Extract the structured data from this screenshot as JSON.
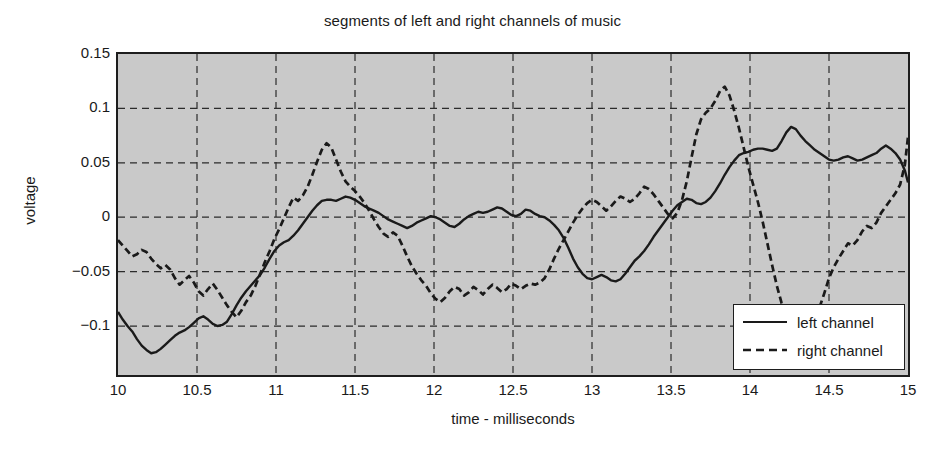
{
  "chart_data": {
    "type": "line",
    "title": "segments of left and right channels of music",
    "xlabel": "time - milliseconds",
    "ylabel": "voltage",
    "xlim": [
      10,
      15
    ],
    "ylim": [
      -0.145,
      0.15
    ],
    "xticks": [
      "10",
      "10.5",
      "11",
      "11.5",
      "12",
      "12.5",
      "13",
      "13.5",
      "14",
      "14.5",
      "15"
    ],
    "xtick_values": [
      10,
      10.5,
      11,
      11.5,
      12,
      12.5,
      13,
      13.5,
      14,
      14.5,
      15
    ],
    "yticks": [
      "0.15",
      "0.1",
      "0.05",
      "0",
      "-0.05",
      "-0.1"
    ],
    "ytick_values": [
      0.15,
      0.1,
      0.05,
      0,
      -0.05,
      -0.1
    ],
    "grid": true,
    "grid_style": "dashed",
    "legend_position": "bottom-right",
    "plot_background": "#c9c9c9",
    "line_color": "#1a1a1a",
    "series": [
      {
        "name": "left channel",
        "style": "solid",
        "x": [
          10.0,
          10.03,
          10.06,
          10.09,
          10.12,
          10.15,
          10.18,
          10.21,
          10.24,
          10.27,
          10.3,
          10.33,
          10.36,
          10.39,
          10.42,
          10.45,
          10.48,
          10.51,
          10.54,
          10.57,
          10.6,
          10.63,
          10.66,
          10.69,
          10.72,
          10.75,
          10.78,
          10.81,
          10.84,
          10.87,
          10.9,
          10.93,
          10.96,
          10.99,
          11.02,
          11.05,
          11.08,
          11.11,
          11.14,
          11.17,
          11.2,
          11.23,
          11.26,
          11.29,
          11.32,
          11.35,
          11.38,
          11.41,
          11.44,
          11.47,
          11.5,
          11.53,
          11.56,
          11.59,
          11.62,
          11.65,
          11.68,
          11.71,
          11.74,
          11.77,
          11.8,
          11.83,
          11.86,
          11.89,
          11.92,
          11.95,
          11.98,
          12.01,
          12.04,
          12.07,
          12.1,
          12.13,
          12.16,
          12.19,
          12.22,
          12.25,
          12.28,
          12.31,
          12.34,
          12.37,
          12.4,
          12.43,
          12.46,
          12.49,
          12.52,
          12.55,
          12.58,
          12.61,
          12.64,
          12.67,
          12.7,
          12.73,
          12.76,
          12.79,
          12.82,
          12.85,
          12.88,
          12.91,
          12.94,
          12.97,
          13.0,
          13.03,
          13.06,
          13.09,
          13.12,
          13.15,
          13.18,
          13.21,
          13.24,
          13.27,
          13.3,
          13.33,
          13.36,
          13.39,
          13.42,
          13.45,
          13.48,
          13.51,
          13.54,
          13.57,
          13.6,
          13.63,
          13.66,
          13.69,
          13.72,
          13.75,
          13.78,
          13.81,
          13.84,
          13.87,
          13.9,
          13.93,
          13.96,
          13.99,
          14.02,
          14.05,
          14.08,
          14.11,
          14.14,
          14.17,
          14.2,
          14.23,
          14.26,
          14.29,
          14.32,
          14.35,
          14.38,
          14.41,
          14.44,
          14.47,
          14.5,
          14.53,
          14.56,
          14.59,
          14.62,
          14.65,
          14.68,
          14.71,
          14.74,
          14.77,
          14.8,
          14.83,
          14.86,
          14.89,
          14.92,
          14.95,
          14.98,
          15.0
        ],
        "y": [
          -0.087,
          -0.094,
          -0.1,
          -0.105,
          -0.112,
          -0.118,
          -0.122,
          -0.125,
          -0.124,
          -0.121,
          -0.117,
          -0.113,
          -0.109,
          -0.106,
          -0.104,
          -0.101,
          -0.097,
          -0.093,
          -0.091,
          -0.094,
          -0.098,
          -0.1,
          -0.099,
          -0.096,
          -0.089,
          -0.081,
          -0.074,
          -0.068,
          -0.063,
          -0.058,
          -0.053,
          -0.046,
          -0.038,
          -0.031,
          -0.026,
          -0.023,
          -0.021,
          -0.017,
          -0.012,
          -0.006,
          0.0,
          0.006,
          0.011,
          0.015,
          0.016,
          0.016,
          0.015,
          0.017,
          0.019,
          0.018,
          0.016,
          0.013,
          0.01,
          0.008,
          0.006,
          0.004,
          0.001,
          -0.002,
          -0.004,
          -0.006,
          -0.008,
          -0.01,
          -0.008,
          -0.005,
          -0.003,
          -0.001,
          0.001,
          0.0,
          -0.002,
          -0.005,
          -0.008,
          -0.009,
          -0.006,
          -0.002,
          0.001,
          0.003,
          0.005,
          0.004,
          0.005,
          0.007,
          0.009,
          0.008,
          0.005,
          0.002,
          0.001,
          0.003,
          0.007,
          0.006,
          0.003,
          0.001,
          0.0,
          -0.003,
          -0.007,
          -0.012,
          -0.019,
          -0.028,
          -0.038,
          -0.046,
          -0.052,
          -0.056,
          -0.057,
          -0.055,
          -0.053,
          -0.055,
          -0.058,
          -0.059,
          -0.057,
          -0.052,
          -0.046,
          -0.04,
          -0.036,
          -0.031,
          -0.025,
          -0.018,
          -0.012,
          -0.006,
          0.0,
          0.006,
          0.011,
          0.014,
          0.017,
          0.016,
          0.013,
          0.012,
          0.014,
          0.018,
          0.024,
          0.031,
          0.039,
          0.046,
          0.052,
          0.057,
          0.059,
          0.06,
          0.062,
          0.063,
          0.063,
          0.062,
          0.061,
          0.063,
          0.07,
          0.078,
          0.083,
          0.081,
          0.075,
          0.07,
          0.066,
          0.062,
          0.059,
          0.056,
          0.053,
          0.052,
          0.053,
          0.055,
          0.056,
          0.054,
          0.052,
          0.053,
          0.055,
          0.057,
          0.059,
          0.063,
          0.066,
          0.063,
          0.059,
          0.053,
          0.043,
          0.032
        ]
      },
      {
        "name": "right channel",
        "style": "dashed",
        "x": [
          10.0,
          10.03,
          10.06,
          10.09,
          10.12,
          10.15,
          10.18,
          10.21,
          10.24,
          10.27,
          10.3,
          10.33,
          10.36,
          10.39,
          10.42,
          10.45,
          10.48,
          10.51,
          10.54,
          10.57,
          10.6,
          10.63,
          10.66,
          10.69,
          10.72,
          10.75,
          10.78,
          10.81,
          10.84,
          10.87,
          10.9,
          10.93,
          10.96,
          10.99,
          11.02,
          11.05,
          11.08,
          11.11,
          11.14,
          11.17,
          11.2,
          11.23,
          11.26,
          11.29,
          11.32,
          11.35,
          11.38,
          11.41,
          11.44,
          11.47,
          11.5,
          11.53,
          11.56,
          11.59,
          11.62,
          11.65,
          11.68,
          11.71,
          11.74,
          11.77,
          11.8,
          11.83,
          11.86,
          11.89,
          11.92,
          11.95,
          11.98,
          12.01,
          12.04,
          12.07,
          12.1,
          12.13,
          12.16,
          12.19,
          12.22,
          12.25,
          12.28,
          12.31,
          12.34,
          12.37,
          12.4,
          12.43,
          12.46,
          12.49,
          12.52,
          12.55,
          12.58,
          12.61,
          12.64,
          12.67,
          12.7,
          12.73,
          12.76,
          12.79,
          12.82,
          12.85,
          12.88,
          12.91,
          12.94,
          12.97,
          13.0,
          13.03,
          13.06,
          13.09,
          13.12,
          13.15,
          13.18,
          13.21,
          13.24,
          13.27,
          13.3,
          13.33,
          13.36,
          13.39,
          13.42,
          13.45,
          13.48,
          13.51,
          13.54,
          13.57,
          13.6,
          13.63,
          13.66,
          13.69,
          13.72,
          13.75,
          13.78,
          13.81,
          13.84,
          13.87,
          13.9,
          13.93,
          13.96,
          13.99,
          14.02,
          14.05,
          14.08,
          14.11,
          14.14,
          14.17,
          14.2,
          14.23,
          14.26,
          14.29,
          14.32,
          14.35,
          14.38,
          14.41,
          14.44,
          14.47,
          14.5,
          14.53,
          14.56,
          14.59,
          14.62,
          14.65,
          14.68,
          14.71,
          14.74,
          14.77,
          14.8,
          14.83,
          14.86,
          14.89,
          14.92,
          14.95,
          14.98,
          15.0
        ],
        "y": [
          -0.021,
          -0.026,
          -0.031,
          -0.036,
          -0.034,
          -0.03,
          -0.032,
          -0.038,
          -0.043,
          -0.047,
          -0.044,
          -0.048,
          -0.056,
          -0.062,
          -0.058,
          -0.054,
          -0.06,
          -0.068,
          -0.072,
          -0.066,
          -0.061,
          -0.067,
          -0.074,
          -0.081,
          -0.087,
          -0.092,
          -0.086,
          -0.078,
          -0.072,
          -0.063,
          -0.052,
          -0.041,
          -0.031,
          -0.02,
          -0.011,
          -0.001,
          0.009,
          0.018,
          0.015,
          0.02,
          0.028,
          0.039,
          0.051,
          0.062,
          0.068,
          0.064,
          0.053,
          0.042,
          0.033,
          0.028,
          0.024,
          0.019,
          0.013,
          0.006,
          -0.002,
          -0.009,
          -0.015,
          -0.018,
          -0.014,
          -0.017,
          -0.026,
          -0.036,
          -0.045,
          -0.052,
          -0.058,
          -0.063,
          -0.07,
          -0.075,
          -0.078,
          -0.074,
          -0.068,
          -0.064,
          -0.066,
          -0.072,
          -0.069,
          -0.064,
          -0.067,
          -0.071,
          -0.066,
          -0.062,
          -0.065,
          -0.069,
          -0.066,
          -0.061,
          -0.063,
          -0.066,
          -0.063,
          -0.061,
          -0.062,
          -0.06,
          -0.056,
          -0.048,
          -0.038,
          -0.029,
          -0.021,
          -0.013,
          -0.005,
          0.002,
          0.008,
          0.013,
          0.016,
          0.014,
          0.01,
          0.006,
          0.01,
          0.015,
          0.019,
          0.017,
          0.014,
          0.017,
          0.022,
          0.028,
          0.026,
          0.021,
          0.015,
          0.009,
          0.003,
          -0.001,
          0.004,
          0.016,
          0.033,
          0.055,
          0.076,
          0.09,
          0.096,
          0.1,
          0.107,
          0.116,
          0.12,
          0.112,
          0.098,
          0.082,
          0.064,
          0.046,
          0.03,
          0.014,
          -0.004,
          -0.024,
          -0.044,
          -0.063,
          -0.079,
          -0.09,
          -0.094,
          -0.093,
          -0.088,
          -0.091,
          -0.094,
          -0.092,
          -0.083,
          -0.07,
          -0.056,
          -0.046,
          -0.038,
          -0.031,
          -0.024,
          -0.026,
          -0.021,
          -0.013,
          -0.008,
          -0.01,
          -0.005,
          0.004,
          0.01,
          0.016,
          0.022,
          0.03,
          0.048,
          0.074
        ]
      }
    ]
  },
  "legend": {
    "items": [
      {
        "label": "left channel",
        "style": "solid"
      },
      {
        "label": "right channel",
        "style": "dashed"
      }
    ]
  }
}
